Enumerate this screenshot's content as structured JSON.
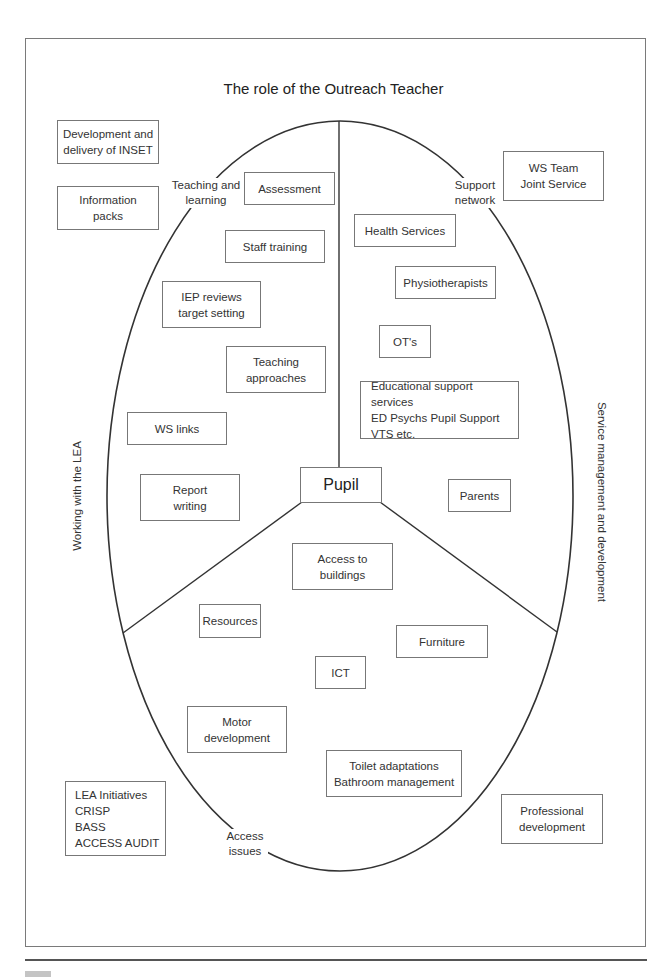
{
  "diagram": {
    "title": "The role of the Outreach Teacher",
    "center": "Pupil",
    "quadrant_labels": {
      "top_left": "Teaching and\nlearning",
      "top_right": "Support\nnetwork",
      "bottom": "Access\nissues"
    },
    "side_labels": {
      "left": "Working with the LEA",
      "right": "Service management and development"
    },
    "outside_boxes": {
      "inset": "Development and\ndelivery of INSET",
      "info_packs": "Information\npacks",
      "ws_team": "WS Team\nJoint Service",
      "lea_initiatives": "LEA Initiatives\nCRISP\nBASS\nACCESS AUDIT",
      "professional_dev": "Professional\ndevelopment"
    },
    "teaching_learning": {
      "assessment": "Assessment",
      "staff_training": "Staff training",
      "iep_reviews": "IEP reviews\ntarget setting",
      "teaching_approaches": "Teaching\napproaches",
      "ws_links": "WS links",
      "report_writing": "Report\nwriting"
    },
    "support_network": {
      "health_services": "Health Services",
      "physiotherapists": "Physiotherapists",
      "ots": "OT's",
      "educational_support": "Educational support services\nED Psychs Pupil Support\nVTS etc.",
      "parents": "Parents"
    },
    "access_issues": {
      "access_buildings": "Access to\nbuildings",
      "resources": "Resources",
      "furniture": "Furniture",
      "ict": "ICT",
      "motor_development": "Motor\ndevelopment",
      "toilet_adaptations": "Toilet adaptations\nBathroom management"
    }
  }
}
